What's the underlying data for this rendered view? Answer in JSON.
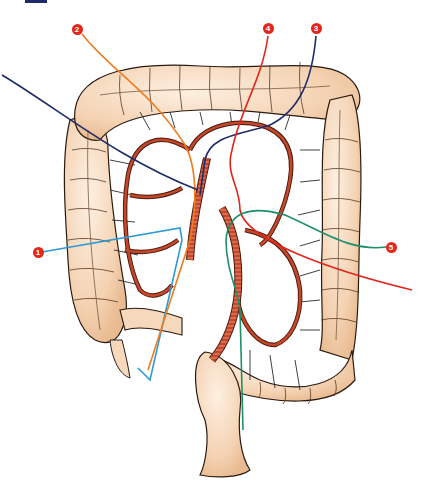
{
  "figure": {
    "corner_tab_color": "#1f2a6b",
    "colors": {
      "bowel_fill": "#f6d9bd",
      "bowel_outline": "#2a1a10",
      "artery_fill": "#c4472a",
      "artery_outline": "#4a1a10",
      "vasa_recta": "#2a2a2a",
      "marker_fill": "#e2261c"
    }
  },
  "markers": [
    {
      "id": "1",
      "label": "1",
      "x": 38,
      "y": 252,
      "line_color": "#2b9ad6"
    },
    {
      "id": "2",
      "label": "2",
      "x": 77,
      "y": 29,
      "line_color": "#f07a1e"
    },
    {
      "id": "3",
      "label": "3",
      "x": 316,
      "y": 28,
      "line_color": "#1f2a6b"
    },
    {
      "id": "4",
      "label": "4",
      "x": 268,
      "y": 28,
      "line_color": "#e2261c"
    },
    {
      "id": "5",
      "label": "5",
      "x": 391,
      "y": 247,
      "line_color": "#1e8f6a"
    }
  ],
  "leader_lines": [
    {
      "id": "line-1-blue",
      "color": "#2b9ad6",
      "d": "M42 252 L180 228 L182 240 L150 380 L138 368"
    },
    {
      "id": "line-2-orange",
      "color": "#f07a1e",
      "d": "M82 34 C110 70 150 90 185 145 C196 165 198 200 190 240 L148 370"
    },
    {
      "id": "line-3-navy",
      "color": "#1f2a6b",
      "d": "M2 75 C60 110 120 160 198 190 M316 36 C312 80 300 110 270 125 C240 135 210 135 205 160 L200 195"
    },
    {
      "id": "line-4-red",
      "color": "#e2261c",
      "d": "M268 36 C262 80 240 110 232 150 C225 175 240 185 240 210 C245 240 330 270 412 290"
    },
    {
      "id": "line-5-green",
      "color": "#1e8f6a",
      "d": "M386 247 C350 252 320 230 285 215 C250 205 228 212 226 240 C226 270 238 290 240 310 L243 430"
    }
  ]
}
